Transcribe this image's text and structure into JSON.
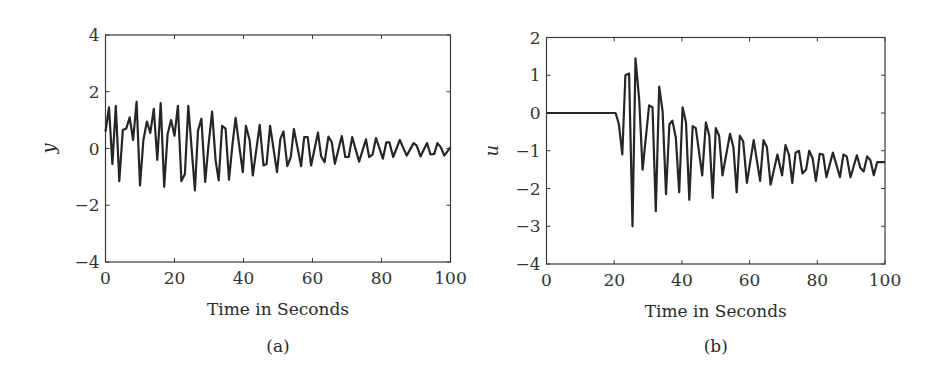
{
  "chart_data": [
    {
      "type": "line",
      "panel_label": "(a)",
      "title": "",
      "xlabel": "Time in Seconds",
      "ylabel": "y",
      "xlim": [
        0,
        100
      ],
      "ylim": [
        -4,
        4
      ],
      "xticks": [
        0,
        20,
        40,
        60,
        80,
        100
      ],
      "yticks": [
        -4,
        -2,
        0,
        2,
        4
      ],
      "xtick_labels": [
        "0",
        "20",
        "40",
        "60",
        "80",
        "100"
      ],
      "ytick_labels": [
        "−4",
        "−2",
        "0",
        "2",
        "4"
      ],
      "grid": false,
      "legend": null,
      "series": [
        {
          "name": "y",
          "x": [
            0,
            1,
            2,
            3,
            4,
            5,
            6,
            7,
            8,
            9,
            10,
            11,
            12,
            13,
            14,
            15,
            16,
            17,
            18,
            19,
            20,
            21,
            22,
            23,
            24,
            25.9,
            26.8,
            27.8,
            28.9,
            29.8,
            30.9,
            31.9,
            32.8,
            33.8,
            34.8,
            35.8,
            36.8,
            37.7,
            38.8,
            39.8,
            40.7,
            41.8,
            42.7,
            44.7,
            45.8,
            46.7,
            47.7,
            49.7,
            50.7,
            51.6,
            52.7,
            53.7,
            54.6,
            56.7,
            57.6,
            58.6,
            59.6,
            61.6,
            62.5,
            63.5,
            64.6,
            65.6,
            66.5,
            68.5,
            69.5,
            70.5,
            71.5,
            73.5,
            75.5,
            76.4,
            77.4,
            78.4,
            80.4,
            81.4,
            82.3,
            83.4,
            85.3,
            87.3,
            89.3,
            90.2,
            91.3,
            93.2,
            94.2,
            95.3,
            96.2,
            97.2,
            98.2,
            100
          ],
          "values": [
            0.6,
            1.45,
            -0.55,
            1.5,
            -1.15,
            0.65,
            0.7,
            1.1,
            0.3,
            1.65,
            -1.3,
            0.3,
            0.95,
            0.55,
            1.4,
            -0.4,
            1.6,
            -1.35,
            0.5,
            1.0,
            0.45,
            1.5,
            -1.15,
            -0.9,
            1.5,
            -1.48,
            0.63,
            1.05,
            -1.18,
            0.05,
            1.3,
            -0.42,
            -1.12,
            0.8,
            0.7,
            -1.1,
            0.15,
            1.08,
            0.05,
            -0.83,
            0.8,
            0.28,
            -0.95,
            0.83,
            -0.6,
            -0.55,
            0.8,
            -0.83,
            0.34,
            0.6,
            -0.62,
            -0.3,
            0.68,
            -0.62,
            0.4,
            0.4,
            -0.6,
            0.56,
            -0.27,
            -0.48,
            0.42,
            0.22,
            -0.54,
            0.44,
            -0.3,
            -0.3,
            0.4,
            -0.46,
            0.32,
            -0.3,
            -0.22,
            0.37,
            -0.36,
            0.22,
            0.22,
            -0.3,
            0.3,
            -0.25,
            0.19,
            0.1,
            -0.28,
            0.19,
            -0.21,
            -0.19,
            0.19,
            0.05,
            -0.25,
            0.05
          ]
        }
      ]
    },
    {
      "type": "line",
      "panel_label": "(b)",
      "title": "",
      "xlabel": "Time in Seconds",
      "ylabel": "u",
      "xlim": [
        0,
        100
      ],
      "ylim": [
        -4,
        2
      ],
      "xticks": [
        0,
        20,
        40,
        60,
        80,
        100
      ],
      "yticks": [
        -4,
        -3,
        -2,
        -1,
        0,
        1,
        2
      ],
      "xtick_labels": [
        "0",
        "20",
        "40",
        "60",
        "80",
        "100"
      ],
      "ytick_labels": [
        "−4",
        "−3",
        "−2",
        "−1",
        "0",
        "1",
        "2"
      ],
      "grid": false,
      "legend": null,
      "series": [
        {
          "name": "u",
          "x": [
            0,
            20.4,
            21.4,
            22.4,
            23.3,
            24.4,
            25.4,
            26.3,
            27.4,
            28.4,
            30.3,
            31.3,
            32.3,
            33.3,
            34.3,
            35.3,
            36.3,
            37.2,
            38.2,
            39.2,
            40.2,
            41.2,
            42.2,
            43.2,
            44.1,
            46,
            47.1,
            48.1,
            49.1,
            50,
            51,
            52,
            54.2,
            55.2,
            56.2,
            57.1,
            58.1,
            59.2,
            61.2,
            63.1,
            64.1,
            65.1,
            66.2,
            68.2,
            69.6,
            70.6,
            71.6,
            72.6,
            73.6,
            74.6,
            75.6,
            76.7,
            77.6,
            78.6,
            79.6,
            80.7,
            81.7,
            82.7,
            84.6,
            86.7,
            87.7,
            88.7,
            89.8,
            91.7,
            92.7,
            93.7,
            94.7,
            95.7,
            96.7,
            97.7,
            100
          ],
          "values": [
            0,
            0,
            -0.3,
            -1.1,
            1.0,
            1.05,
            -3.0,
            1.45,
            0.35,
            -1.5,
            0.2,
            0.15,
            -2.6,
            0.7,
            0.05,
            -2.15,
            -0.3,
            -0.2,
            -0.65,
            -2.1,
            0.15,
            -0.25,
            -2.3,
            -0.35,
            -0.4,
            -1.65,
            -0.25,
            -0.6,
            -2.25,
            -0.4,
            -0.6,
            -1.65,
            -0.55,
            -0.9,
            -2.1,
            -0.6,
            -0.75,
            -1.85,
            -0.72,
            -1.8,
            -0.72,
            -0.9,
            -1.9,
            -1.1,
            -1.65,
            -0.85,
            -1.1,
            -1.85,
            -1.05,
            -1.0,
            -1.6,
            -1.5,
            -1.0,
            -1.2,
            -1.8,
            -1.08,
            -1.1,
            -1.7,
            -1.05,
            -1.7,
            -1.1,
            -1.15,
            -1.7,
            -1.12,
            -1.45,
            -1.55,
            -1.15,
            -1.25,
            -1.65,
            -1.3,
            -1.3
          ]
        }
      ]
    }
  ]
}
